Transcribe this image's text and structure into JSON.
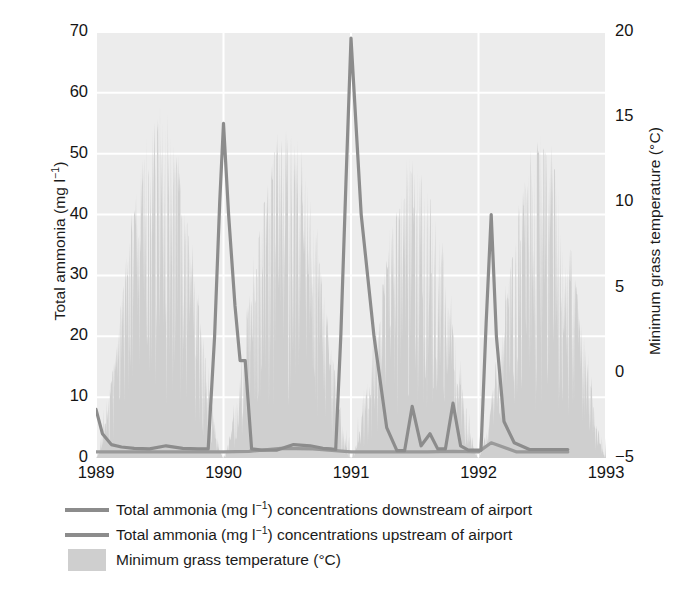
{
  "figure": {
    "background": "#ffffff",
    "plot_background": "#ececec",
    "gridline_color": "#ffffff"
  },
  "axes": {
    "left": {
      "title_text": "Total ammonia (mg l",
      "title_sup": "−1",
      "title_tail": ")",
      "title_full": "Total ammonia (mg l⁻¹)",
      "ticks": [
        "70",
        "60",
        "50",
        "40",
        "30",
        "20",
        "10",
        "0"
      ],
      "min": 0,
      "max": 70
    },
    "right": {
      "title_full": "Minimum grass temperature (°C)",
      "ticks": [
        "20",
        "15",
        "10",
        "5",
        "0",
        "−5"
      ],
      "min": -5,
      "max": 20
    },
    "bottom": {
      "ticks": [
        "1989",
        "1990",
        "1991",
        "1992",
        "1993"
      ],
      "min": 1989,
      "max": 1993
    }
  },
  "legend": {
    "items": [
      {
        "type": "line",
        "color": "#8c8c8c",
        "label_head": "Total ammonia (mg l",
        "label_sup": "−1",
        "label_tail": ") concentrations downstream of airport",
        "label_full": "Total ammonia (mg l⁻¹) concentrations downstream of airport"
      },
      {
        "type": "line",
        "color": "#8c8c8c",
        "label_head": "Total ammonia (mg l",
        "label_sup": "−1",
        "label_tail": ") concentrations upstream of airport",
        "label_full": "Total ammonia (mg l⁻¹) concentrations upstream of airport"
      },
      {
        "type": "area",
        "color": "#cfcfcf",
        "label_head": "Minimum grass temperature (°C)",
        "label_sup": "",
        "label_tail": "",
        "label_full": "Minimum grass temperature (°C)"
      }
    ]
  },
  "chart_data": {
    "type": "line",
    "title": "",
    "xlabel": "",
    "ylabel": "Total ammonia (mg l⁻¹)",
    "y2label": "Minimum grass temperature (°C)",
    "xlim": [
      1989.0,
      1993.0
    ],
    "ylim": [
      0,
      70
    ],
    "y2lim": [
      -5,
      20
    ],
    "xticks": [
      1989,
      1990,
      1991,
      1992,
      1993
    ],
    "yticks": [
      0,
      10,
      20,
      30,
      40,
      50,
      60,
      70
    ],
    "y2ticks": [
      -5,
      0,
      5,
      10,
      15,
      20
    ],
    "grid": true,
    "legend_position": "below-axes",
    "series": [
      {
        "name": "Total ammonia (mg l⁻¹) concentrations downstream of airport",
        "axis": "left",
        "color": "#8c8c8c",
        "x": [
          1989.0,
          1989.05,
          1989.12,
          1989.2,
          1989.3,
          1989.42,
          1989.55,
          1989.68,
          1989.8,
          1989.88,
          1989.93,
          1989.97,
          1990.0,
          1990.04,
          1990.09,
          1990.13,
          1990.17,
          1990.22,
          1990.3,
          1990.42,
          1990.55,
          1990.68,
          1990.78,
          1990.84,
          1990.88,
          1990.92,
          1990.96,
          1991.0,
          1991.08,
          1991.18,
          1991.28,
          1991.36,
          1991.42,
          1991.48,
          1991.55,
          1991.62,
          1991.68,
          1991.74,
          1991.8,
          1991.86,
          1991.92,
          1991.97,
          1992.02,
          1992.06,
          1992.1,
          1992.14,
          1992.2,
          1992.28,
          1992.4,
          1992.55,
          1992.7
        ],
        "y": [
          8.0,
          4.0,
          2.2,
          1.8,
          1.6,
          1.5,
          2.0,
          1.6,
          1.5,
          1.5,
          20.0,
          42.0,
          55.0,
          40.0,
          25.0,
          16.0,
          16.0,
          1.5,
          1.3,
          1.3,
          2.2,
          2.0,
          1.6,
          1.5,
          1.4,
          20.0,
          45.0,
          69.0,
          40.0,
          20.0,
          5.0,
          1.2,
          1.2,
          8.5,
          2.0,
          4.0,
          1.5,
          1.5,
          9.0,
          2.0,
          1.3,
          1.3,
          1.3,
          22.0,
          40.0,
          20.0,
          6.0,
          2.5,
          1.4,
          1.4,
          1.4
        ]
      },
      {
        "name": "Total ammonia (mg l⁻¹) concentrations upstream of airport",
        "axis": "left",
        "color": "#9a9a9a",
        "x": [
          1989.0,
          1989.2,
          1989.5,
          1989.8,
          1990.0,
          1990.2,
          1990.45,
          1990.7,
          1990.95,
          1991.0,
          1991.2,
          1991.4,
          1991.6,
          1991.8,
          1992.0,
          1992.1,
          1992.3,
          1992.5,
          1992.7
        ],
        "y": [
          1.0,
          1.0,
          1.0,
          1.0,
          1.0,
          1.1,
          1.6,
          1.5,
          1.1,
          1.0,
          1.0,
          1.0,
          1.0,
          1.1,
          1.0,
          2.5,
          1.0,
          1.0,
          1.0
        ]
      },
      {
        "name": "Minimum grass temperature (°C)",
        "axis": "right",
        "type": "area",
        "color": "#cfcfcf",
        "description": "Daily minimum grass temperature, strongly seasonal, summer peaks approx 14-15 °C, winter troughs approx -5 °C, plotted as a filled spiky area.",
        "seasonal_summer_peak_c": [
          15.0,
          14.3,
          12.0,
          13.2
        ],
        "seasonal_winter_trough_c": [
          -5.0,
          -5.0,
          -5.0,
          -5.0
        ],
        "peak_years": [
          1989.5,
          1990.5,
          1991.5,
          1992.5
        ]
      }
    ]
  }
}
